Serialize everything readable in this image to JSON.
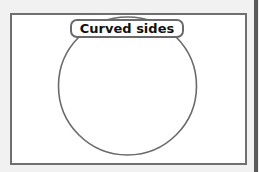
{
  "diagram": {
    "label": "Curved sides",
    "shape": "circle",
    "colors": {
      "background": "#f1f1f1",
      "frame_fill": "#ffffff",
      "stroke": "#6a6a6a",
      "text": "#111111"
    }
  }
}
